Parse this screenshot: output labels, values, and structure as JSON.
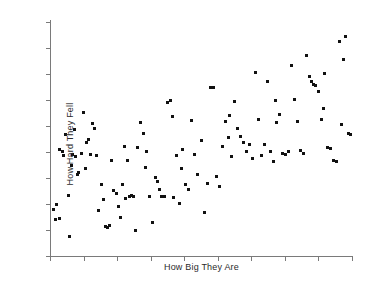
{
  "figure": {
    "width": 365,
    "height": 285,
    "background_color": "#ffffff"
  },
  "axes": {
    "spine_color": "#7a7a7a",
    "marker_color": "#111111",
    "x_label": "How Big They Are",
    "y_label": "How Hard They Fell",
    "x_tick_count": 10,
    "y_tick_count": 10,
    "tick_labels_shown": false,
    "grid": false
  },
  "chart_data": {
    "type": "scatter",
    "title": "",
    "xlabel": "How Big They Are",
    "ylabel": "How Hard They Fell",
    "xlim": [
      0,
      100
    ],
    "ylim": [
      0,
      100
    ],
    "grid": false,
    "legend": null,
    "series": [
      {
        "name": "observations",
        "color": "#111111",
        "marker": "square",
        "marker_size": 3,
        "points": [
          [
            2.0,
            22.0
          ],
          [
            1.7,
            15.5
          ],
          [
            3.3,
            16.2
          ],
          [
            3.0,
            45.5
          ],
          [
            4.0,
            44.5
          ],
          [
            4.6,
            43.0
          ],
          [
            5.0,
            52.0
          ],
          [
            6.0,
            26.0
          ],
          [
            6.3,
            8.5
          ],
          [
            7.0,
            38.5
          ],
          [
            7.6,
            43.5
          ],
          [
            8.3,
            42.5
          ],
          [
            9.0,
            35.0
          ],
          [
            9.6,
            35.5
          ],
          [
            10.3,
            44.0
          ],
          [
            11.0,
            61.5
          ],
          [
            12.0,
            48.5
          ],
          [
            12.6,
            50.0
          ],
          [
            13.3,
            43.5
          ],
          [
            14.0,
            56.5
          ],
          [
            14.6,
            54.5
          ],
          [
            15.3,
            43.0
          ],
          [
            16.0,
            19.5
          ],
          [
            17.0,
            30.5
          ],
          [
            17.6,
            24.0
          ],
          [
            18.3,
            12.5
          ],
          [
            19.0,
            12.0
          ],
          [
            19.6,
            13.0
          ],
          [
            20.3,
            41.0
          ],
          [
            21.0,
            28.0
          ],
          [
            22.0,
            26.5
          ],
          [
            22.6,
            21.0
          ],
          [
            23.3,
            16.5
          ],
          [
            24.0,
            30.5
          ],
          [
            25.0,
            24.5
          ],
          [
            25.6,
            41.0
          ],
          [
            26.3,
            25.5
          ],
          [
            27.0,
            25.8
          ],
          [
            27.6,
            25.5
          ],
          [
            28.3,
            11.0
          ],
          [
            29.0,
            46.5
          ],
          [
            30.0,
            57.0
          ],
          [
            31.0,
            52.5
          ],
          [
            32.0,
            44.5
          ],
          [
            33.0,
            25.5
          ],
          [
            34.0,
            14.5
          ],
          [
            35.0,
            33.5
          ],
          [
            35.6,
            32.0
          ],
          [
            36.3,
            28.5
          ],
          [
            37.0,
            25.5
          ],
          [
            38.0,
            25.3
          ],
          [
            39.0,
            65.5
          ],
          [
            40.0,
            66.5
          ],
          [
            40.6,
            59.5
          ],
          [
            41.0,
            25.0
          ],
          [
            42.0,
            43.0
          ],
          [
            43.0,
            22.5
          ],
          [
            44.0,
            45.5
          ],
          [
            45.0,
            30.5
          ],
          [
            46.0,
            28.5
          ],
          [
            47.0,
            58.0
          ],
          [
            48.0,
            43.5
          ],
          [
            49.0,
            35.0
          ],
          [
            50.0,
            49.5
          ],
          [
            51.0,
            18.5
          ],
          [
            52.0,
            31.0
          ],
          [
            53.0,
            72.0
          ],
          [
            54.0,
            72.0
          ],
          [
            55.0,
            34.0
          ],
          [
            56.0,
            29.5
          ],
          [
            57.0,
            47.0
          ],
          [
            58.0,
            57.5
          ],
          [
            59.0,
            50.5
          ],
          [
            60.0,
            42.5
          ],
          [
            61.0,
            66.0
          ],
          [
            62.0,
            54.5
          ],
          [
            63.0,
            51.0
          ],
          [
            64.0,
            48.5
          ],
          [
            65.0,
            44.5
          ],
          [
            66.0,
            47.5
          ],
          [
            67.0,
            41.5
          ],
          [
            68.0,
            78.5
          ],
          [
            69.0,
            58.5
          ],
          [
            70.0,
            43.0
          ],
          [
            71.0,
            47.5
          ],
          [
            72.0,
            74.5
          ],
          [
            73.0,
            44.5
          ],
          [
            74.0,
            40.5
          ],
          [
            75.0,
            57.0
          ],
          [
            76.0,
            60.5
          ],
          [
            77.0,
            44.0
          ],
          [
            78.0,
            43.5
          ],
          [
            79.0,
            44.5
          ],
          [
            80.0,
            81.5
          ],
          [
            81.0,
            67.0
          ],
          [
            82.0,
            57.5
          ],
          [
            83.0,
            45.0
          ],
          [
            84.0,
            44.0
          ],
          [
            85.0,
            85.5
          ],
          [
            86.0,
            76.5
          ],
          [
            86.6,
            74.5
          ],
          [
            87.3,
            73.5
          ],
          [
            88.0,
            73.0
          ],
          [
            89.0,
            70.5
          ],
          [
            90.0,
            58.5
          ],
          [
            91.0,
            78.0
          ],
          [
            92.0,
            46.5
          ],
          [
            93.0,
            46.0
          ],
          [
            94.0,
            41.0
          ],
          [
            95.0,
            40.5
          ],
          [
            96.0,
            91.5
          ],
          [
            96.6,
            56.0
          ],
          [
            97.3,
            84.0
          ],
          [
            98.0,
            94.0
          ],
          [
            99.0,
            52.5
          ],
          [
            99.6,
            52.0
          ],
          [
            1.0,
            20.0
          ],
          [
            8.0,
            54.0
          ],
          [
            11.6,
            37.5
          ],
          [
            24.6,
            47.0
          ],
          [
            31.6,
            38.0
          ],
          [
            43.6,
            37.5
          ],
          [
            59.6,
            60.0
          ],
          [
            74.6,
            66.5
          ],
          [
            90.6,
            63.0
          ]
        ]
      }
    ]
  }
}
